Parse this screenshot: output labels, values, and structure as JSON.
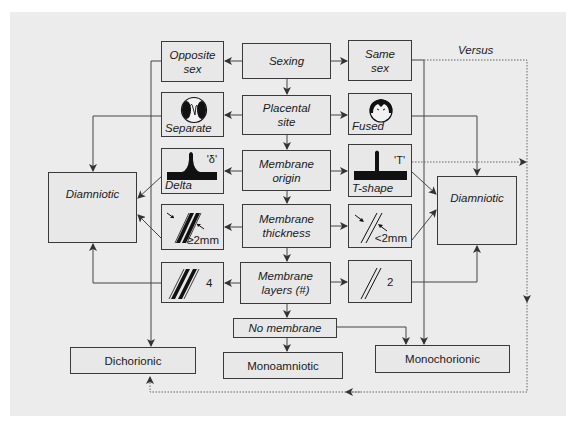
{
  "diagram": {
    "center": {
      "sexing": "Sexing",
      "placental_site": [
        "Placental",
        "site"
      ],
      "membrane_origin": [
        "Membrane",
        "origin"
      ],
      "membrane_thickness": [
        "Membrane",
        "thickness"
      ],
      "membrane_layers": [
        "Membrane",
        "layers (#)"
      ],
      "no_membrane": "No membrane",
      "monoamniotic": "Monoamniotic"
    },
    "left": {
      "opposite_sex": [
        "Opposite",
        "sex"
      ],
      "separate": {
        "label": "Separate",
        "icon": "separate-placentas-icon"
      },
      "delta": {
        "label": "Delta",
        "symbol": "'δ'",
        "icon": "delta-sign-icon"
      },
      "thick": {
        "label": "≥2mm",
        "icon": "thick-membrane-icon"
      },
      "layers4": {
        "label": "4",
        "icon": "four-layer-membrane-icon"
      },
      "diamniotic": "Diamniotic",
      "dichorionic": "Dichorionic"
    },
    "right": {
      "same_sex": [
        "Same",
        "sex"
      ],
      "fused": {
        "label": "Fused",
        "icon": "fused-placenta-icon"
      },
      "tshape": {
        "label": "T-shape",
        "symbol": "'T'",
        "icon": "t-sign-icon"
      },
      "thin": {
        "label": "<2mm",
        "icon": "thin-membrane-icon"
      },
      "layers2": {
        "label": "2",
        "icon": "two-layer-membrane-icon"
      },
      "diamniotic": "Diamniotic",
      "monochorionic": "Monochorionic"
    },
    "versus_label": "Versus",
    "colors": {
      "background": "#ececec",
      "box_fill": "#e8e8e8",
      "line": "#3a3a3a",
      "icon": "#111111"
    }
  }
}
